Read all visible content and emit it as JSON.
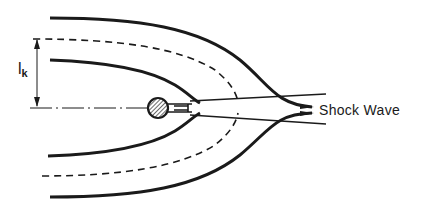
{
  "diagram": {
    "labels": {
      "shock_wave": "Shock Wave",
      "length_symbol": "l",
      "length_subscript": "k"
    },
    "elements": {
      "outer_streamlines": 2,
      "dashed_boundary_lines": 2,
      "inner_streamlines": 2,
      "body": "hatched circle with wake",
      "axis": "dash-dot centerline"
    },
    "colors": {
      "stroke": "#1a1a1a",
      "background": "#ffffff"
    }
  }
}
